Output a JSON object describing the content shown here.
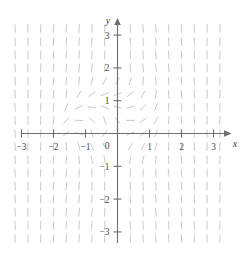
{
  "figure": {
    "kind": "slope-field",
    "background_color": "#ffffff",
    "axis_color": "#6e6e6e",
    "slope_color": "#c9c9c9",
    "label_color": "#4a4a4a"
  },
  "axes": {
    "x_name": "x",
    "y_name": "y",
    "origin_label": "0",
    "x_ticks": [
      {
        "value": -3,
        "label": "−3"
      },
      {
        "value": -2,
        "label": "−2"
      },
      {
        "value": -1,
        "label": "−1"
      },
      {
        "value": 1,
        "label": "1"
      },
      {
        "value": 2,
        "label": "2"
      },
      {
        "value": 3,
        "label": "3"
      }
    ],
    "y_ticks": [
      {
        "value": 3,
        "label": "3"
      },
      {
        "value": 2,
        "label": "2"
      },
      {
        "value": 1,
        "label": "1"
      },
      {
        "value": -1,
        "label": "−1"
      },
      {
        "value": -2,
        "label": "−2"
      },
      {
        "value": -3,
        "label": "−3"
      }
    ]
  },
  "chart_data": {
    "type": "scatter",
    "subtype": "slope-field",
    "title": "",
    "xlabel": "x",
    "ylabel": "y",
    "xlim": [
      -3.45,
      3.45
    ],
    "ylim": [
      -3.45,
      3.45
    ],
    "grid": false,
    "legend": "none",
    "xticks": [
      -3,
      -2,
      -1,
      0,
      1,
      2,
      3
    ],
    "yticks": [
      -3,
      -2,
      -1,
      0,
      1,
      2,
      3
    ],
    "field": {
      "description": "Direction field of dy/dx; tick segments drawn on a uniform lattice. Segments are steep (near-vertical) far from the origin and flatten toward horizontal near the origin and near the lines y = x and y = -x.",
      "slope_formula": "dy/dx = y/x rotated: segment angle = atan2(x, -y) style swirl; rendered value m = -x/y with clamping",
      "sample_spacing": 0.4,
      "x_samples": [
        -3.2,
        -2.8,
        -2.4,
        -2.0,
        -1.6,
        -1.2,
        -0.8,
        -0.4,
        0.0,
        0.4,
        0.8,
        1.2,
        1.6,
        2.0,
        2.4,
        2.8,
        3.2
      ],
      "y_samples": [
        -3.2,
        -2.8,
        -2.4,
        -2.0,
        -1.6,
        -1.2,
        -0.8,
        -0.4,
        0.0,
        0.4,
        0.8,
        1.2,
        1.6,
        2.0,
        2.4,
        2.8,
        3.2
      ],
      "segment_length_px": 8.5
    }
  }
}
